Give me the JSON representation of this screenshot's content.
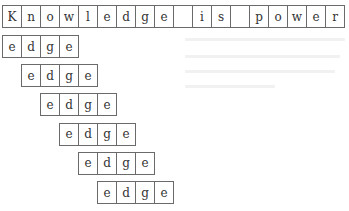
{
  "sentence": {
    "cells": [
      "K",
      "n",
      "o",
      "w",
      "l",
      "e",
      "d",
      "g",
      "e",
      "",
      "i",
      "s",
      "",
      "p",
      "o",
      "w",
      "e",
      "r"
    ]
  },
  "word_rows": [
    {
      "cells": [
        "e",
        "d",
        "g",
        "e"
      ]
    },
    {
      "cells": [
        "e",
        "d",
        "g",
        "e"
      ]
    },
    {
      "cells": [
        "e",
        "d",
        "g",
        "e"
      ]
    },
    {
      "cells": [
        "e",
        "d",
        "g",
        "e"
      ]
    },
    {
      "cells": [
        "e",
        "d",
        "g",
        "e"
      ]
    },
    {
      "cells": [
        "e",
        "d",
        "g",
        "e"
      ]
    }
  ]
}
